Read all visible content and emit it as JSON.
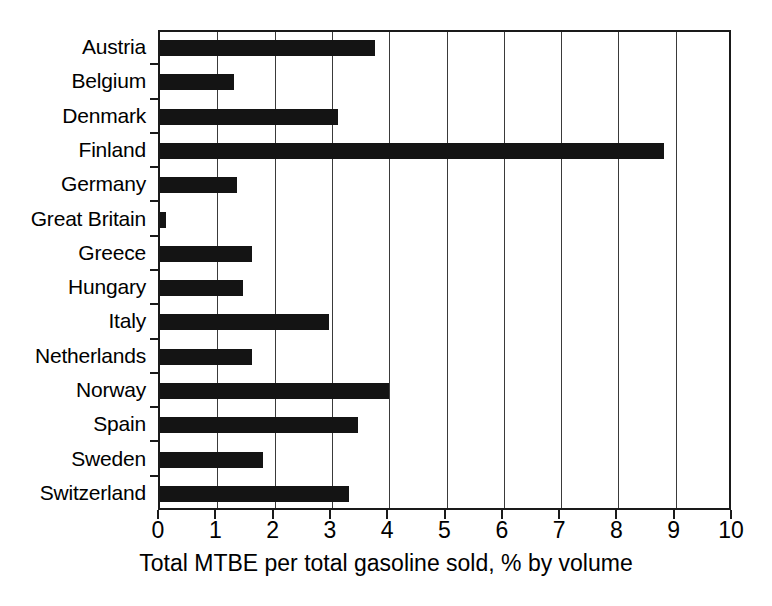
{
  "chart_data": {
    "type": "bar",
    "orientation": "horizontal",
    "title": "",
    "xlabel": "Total MTBE per total gasoline sold, % by volume",
    "ylabel": "",
    "categories": [
      "Austria",
      "Belgium",
      "Denmark",
      "Finland",
      "Germany",
      "Great Britain",
      "Greece",
      "Hungary",
      "Italy",
      "Netherlands",
      "Norway",
      "Spain",
      "Sweden",
      "Switzerland"
    ],
    "values": [
      3.75,
      1.3,
      3.1,
      8.8,
      1.35,
      0.1,
      1.6,
      1.45,
      2.95,
      1.6,
      4.0,
      3.45,
      1.8,
      3.3
    ],
    "xlim": [
      0,
      10
    ],
    "xticks": [
      0,
      1,
      2,
      3,
      4,
      5,
      6,
      7,
      8,
      9,
      10
    ],
    "xtick_labels": [
      "0",
      "1",
      "2",
      "3",
      "4",
      "5",
      "6",
      "7",
      "8",
      "9",
      "10"
    ],
    "grid": "vertical",
    "legend": null,
    "bar_color": "#141414",
    "axis_color": "#1a1a1a",
    "grid_color": "#3a3a3a",
    "background": "#ffffff"
  }
}
